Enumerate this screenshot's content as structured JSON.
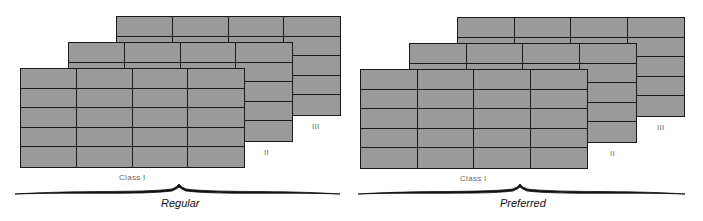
{
  "figures": [
    {
      "caption": "Regular",
      "sheet_labels": [
        "Class I",
        "II",
        "III"
      ],
      "grid": {
        "columns": 4,
        "rows": 5
      }
    },
    {
      "caption": "Preferred",
      "sheet_labels": [
        "Class I",
        "II",
        "III"
      ],
      "grid": {
        "columns": 4,
        "rows": 5
      }
    }
  ],
  "colors": {
    "sheet_fill": "#9a9a9a",
    "grid_line": "#1a1a1a",
    "label": "#666666"
  }
}
